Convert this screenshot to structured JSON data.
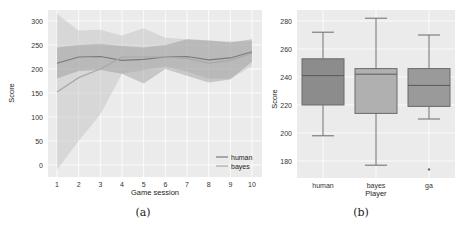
{
  "chart_data": [
    {
      "type": "line",
      "panel": "(a)",
      "title": "",
      "xlabel": "Game session",
      "ylabel": "Score",
      "x": [
        1,
        2,
        3,
        4,
        5,
        6,
        7,
        8,
        9,
        10
      ],
      "xticks": [
        "1",
        "2",
        "3",
        "4",
        "5",
        "6",
        "7",
        "8",
        "9",
        "10"
      ],
      "yticks": [
        "0",
        "50",
        "100",
        "150",
        "200",
        "250",
        "300"
      ],
      "ylim": [
        -15,
        320
      ],
      "grid": true,
      "legend_position": "lower right",
      "series": [
        {
          "name": "human",
          "color": "#7a7a7a",
          "values": [
            212,
            225,
            226,
            218,
            220,
            225,
            226,
            219,
            223,
            236
          ],
          "ci_upper": [
            245,
            250,
            252,
            248,
            245,
            250,
            262,
            260,
            255,
            262
          ],
          "ci_lower": [
            180,
            196,
            198,
            190,
            170,
            200,
            186,
            172,
            178,
            215
          ]
        },
        {
          "name": "bayes",
          "color": "#a8a8a8",
          "values": [
            152,
            182,
            200,
            225,
            225,
            225,
            222,
            212,
            218,
            233
          ],
          "ci_upper": [
            315,
            280,
            282,
            270,
            285,
            265,
            262,
            258,
            258,
            258
          ],
          "ci_lower": [
            -10,
            50,
            105,
            190,
            198,
            205,
            195,
            180,
            180,
            205
          ]
        }
      ]
    },
    {
      "type": "box",
      "panel": "(b)",
      "title": "",
      "xlabel": "Player",
      "ylabel": "Score",
      "categories": [
        "human",
        "bayes",
        "ga"
      ],
      "yticks": [
        "180",
        "200",
        "220",
        "240",
        "260",
        "280"
      ],
      "ylim": [
        168,
        287
      ],
      "grid": true,
      "boxes": [
        {
          "name": "human",
          "whisker_low": 198,
          "q1": 220,
          "median": 241,
          "q3": 253,
          "whisker_high": 272,
          "outliers": [],
          "color": "#8c8c8c"
        },
        {
          "name": "bayes",
          "whisker_low": 177,
          "q1": 214,
          "median": 242,
          "q3": 246,
          "whisker_high": 282,
          "outliers": [],
          "color": "#b0b0b0"
        },
        {
          "name": "ga",
          "whisker_low": 210,
          "q1": 219,
          "median": 234,
          "q3": 246,
          "whisker_high": 270,
          "outliers": [
            174
          ],
          "color": "#9a9a9a"
        }
      ]
    }
  ],
  "captions": {
    "a": "(a)",
    "b": "(b)"
  },
  "left": {
    "xlabel": "Game session",
    "ylabel": "Score",
    "legend": [
      "human",
      "bayes"
    ],
    "xticks": [
      "1",
      "2",
      "3",
      "4",
      "5",
      "6",
      "7",
      "8",
      "9",
      "10"
    ],
    "yticks": [
      "0",
      "50",
      "100",
      "150",
      "200",
      "250",
      "300"
    ]
  },
  "right": {
    "xlabel": "Player",
    "ylabel": "Score",
    "categories": [
      "human",
      "bayes",
      "ga"
    ],
    "yticks": [
      "180",
      "200",
      "220",
      "240",
      "260",
      "280"
    ]
  }
}
